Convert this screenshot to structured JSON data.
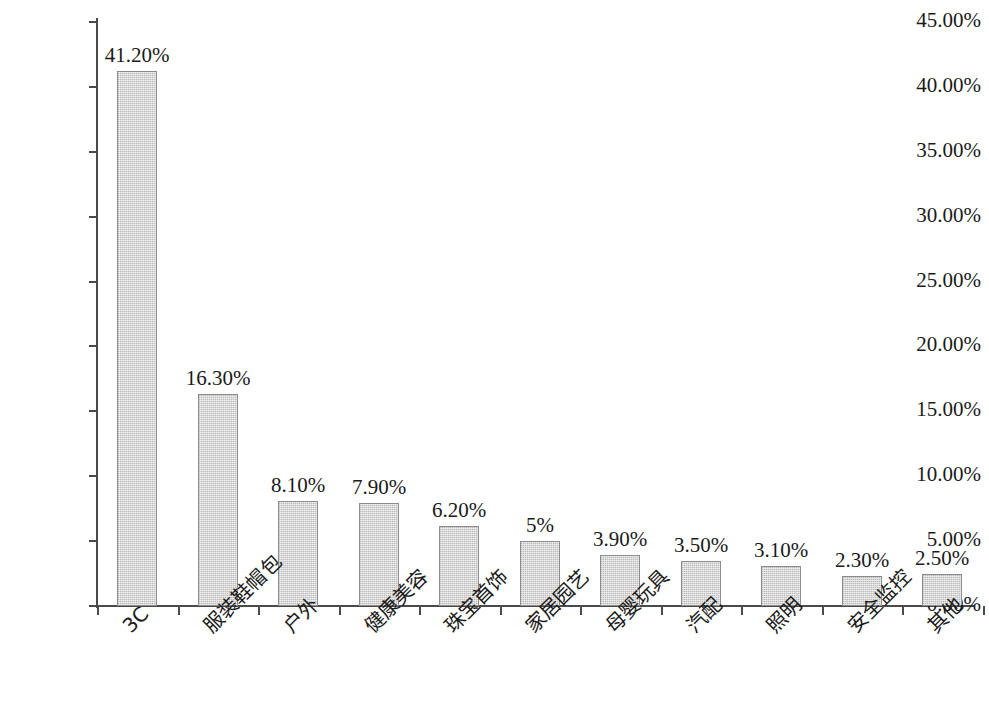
{
  "chart_data": {
    "type": "bar",
    "title": "",
    "subtitle": "",
    "xlabel": "",
    "ylabel": "",
    "grid": false,
    "legend": false,
    "ylim": [
      0,
      45
    ],
    "ytick_labels": [
      "45.00%",
      "40.00%",
      "35.00%",
      "30.00%",
      "25.00%",
      "20.00%",
      "15.00%",
      "10.00%",
      "5.00%",
      "0.00%"
    ],
    "ytick_values": [
      45,
      40,
      35,
      30,
      25,
      20,
      15,
      10,
      5,
      0
    ],
    "categories": [
      "3C",
      "服装鞋帽包",
      "户外",
      "健康美容",
      "珠宝首饰",
      "家居园艺",
      "母婴玩具",
      "汽配",
      "照明",
      "安全监控",
      "其他"
    ],
    "values": [
      41.2,
      16.3,
      8.1,
      7.9,
      6.2,
      5.0,
      3.9,
      3.5,
      3.1,
      2.3,
      2.5
    ],
    "data_labels": [
      "41.20%",
      "16.30%",
      "8.10%",
      "7.90%",
      "6.20%",
      "5%",
      "3.90%",
      "3.50%",
      "3.10%",
      "2.30%",
      "2.50%"
    ],
    "colors": {
      "bar_fill": "#d9d9d9",
      "bar_border": "#8c8c8c",
      "axis": "#4a4a4a",
      "text": "#1a1a1a",
      "background": "#ffffff"
    }
  }
}
